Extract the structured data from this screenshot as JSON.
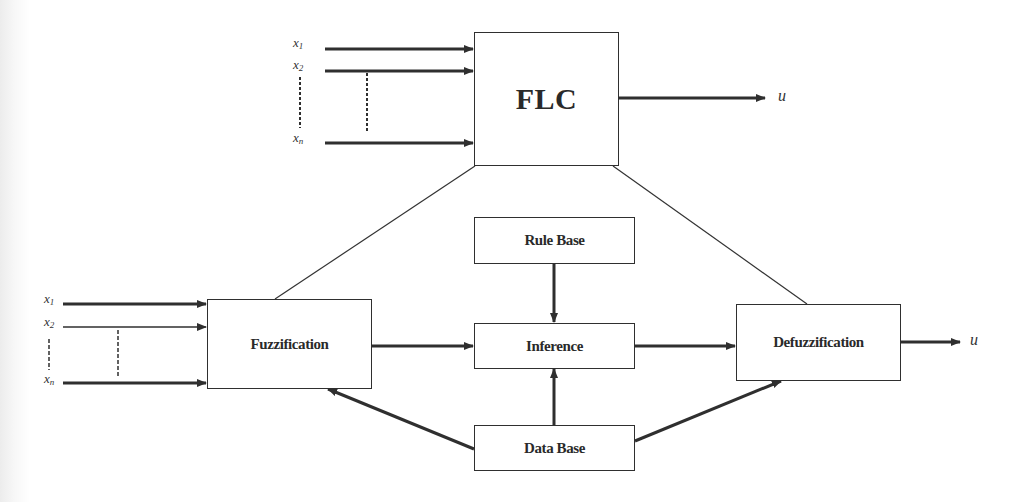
{
  "diagram": {
    "top": {
      "block_label": "FLC",
      "inputs": [
        {
          "name": "x",
          "sub": "1"
        },
        {
          "name": "x",
          "sub": "2"
        },
        {
          "name": "x",
          "sub": "n"
        }
      ],
      "output_label": "u"
    },
    "bottom": {
      "inputs": [
        {
          "name": "x",
          "sub": "1"
        },
        {
          "name": "x",
          "sub": "2"
        },
        {
          "name": "x",
          "sub": "n"
        }
      ],
      "blocks": {
        "fuzzification": "Fuzzification",
        "rule_base": "Rule Base",
        "inference": "Inference",
        "defuzzification": "Defuzzification",
        "data_base": "Data Base"
      },
      "output_label": "u"
    },
    "edges": [
      {
        "from": "x1",
        "to": "FLC"
      },
      {
        "from": "x2",
        "to": "FLC"
      },
      {
        "from": "xn",
        "to": "FLC"
      },
      {
        "from": "FLC",
        "to": "u"
      },
      {
        "from": "FLC",
        "to": "Fuzzification",
        "style": "thin-line"
      },
      {
        "from": "FLC",
        "to": "Defuzzification",
        "style": "thin-line"
      },
      {
        "from": "x1",
        "to": "Fuzzification"
      },
      {
        "from": "x2",
        "to": "Fuzzification"
      },
      {
        "from": "xn",
        "to": "Fuzzification"
      },
      {
        "from": "Fuzzification",
        "to": "Inference"
      },
      {
        "from": "Rule Base",
        "to": "Inference"
      },
      {
        "from": "Data Base",
        "to": "Inference"
      },
      {
        "from": "Data Base",
        "to": "Fuzzification"
      },
      {
        "from": "Data Base",
        "to": "Defuzzification"
      },
      {
        "from": "Inference",
        "to": "Defuzzification"
      },
      {
        "from": "Defuzzification",
        "to": "u"
      }
    ],
    "colors": {
      "line": "#2f2f2f",
      "background": "#ffffff"
    }
  }
}
